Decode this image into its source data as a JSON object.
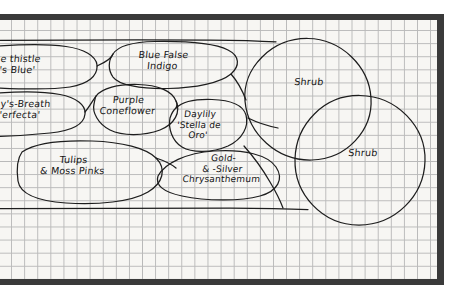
{
  "diagram": {
    "type": "hand-drawn-garden-bed-plan",
    "medium": "pencil on graph paper",
    "paper": {
      "grid_color": "#b9b9b9",
      "paper_color": "#f7f6f3",
      "border_color": "#3a3a3a",
      "grid_square_px": 13
    },
    "ink_color": "#1d1d1d"
  },
  "plants": [
    {
      "id": "globe-thistle",
      "label": "e thistle\n's Blue'",
      "note": "clipped at left image edge",
      "x": 30,
      "y": 62
    },
    {
      "id": "babys-breath",
      "label": "y's-Breath\n'erfecta'",
      "note": "clipped at left image edge",
      "x": 28,
      "y": 107
    },
    {
      "id": "blue-false-indigo",
      "label": "Blue False\nIndigo",
      "x": 162,
      "y": 62
    },
    {
      "id": "purple-coneflower",
      "label": "Purple\nConeflower",
      "x": 127,
      "y": 107
    },
    {
      "id": "daylily-stella-de-oro",
      "label": "Daylily\n'Stella de\nOro'",
      "x": 200,
      "y": 128
    },
    {
      "id": "tulips-moss-pinks",
      "label": "Tulips\n& Moss Pinks",
      "x": 73,
      "y": 172
    },
    {
      "id": "gold-silver-chrysanthemum",
      "label": "Gold-\n& -Silver\nChrysanthemum",
      "x": 222,
      "y": 172
    },
    {
      "id": "shrub-upper",
      "label": "Shrub",
      "x": 308,
      "y": 81
    },
    {
      "id": "shrub-lower",
      "label": "Shrub",
      "x": 362,
      "y": 152
    }
  ]
}
